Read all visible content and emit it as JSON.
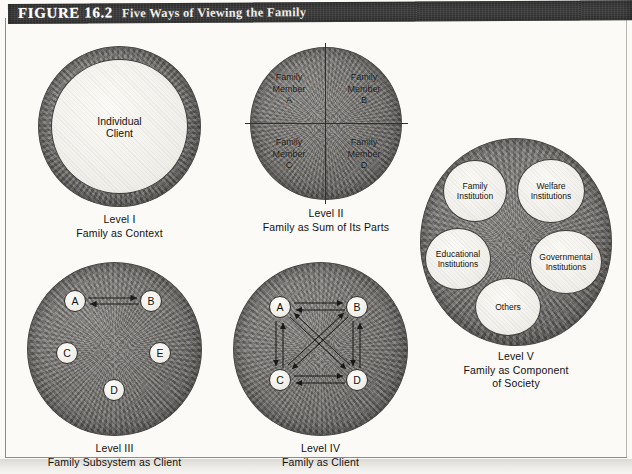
{
  "header": {
    "figure_label": "FIGURE 16.2",
    "figure_title": "Five Ways of Viewing the Family"
  },
  "levels": [
    {
      "id": "level-1",
      "caption_line1": "Level I",
      "caption_line2": "Family as Context",
      "center_label_line1": "Individual",
      "center_label_line2": "Client"
    },
    {
      "id": "level-2",
      "caption_line1": "Level II",
      "caption_line2": "Family as Sum of Its Parts",
      "quadrants": [
        {
          "line1": "Family",
          "line2": "Member",
          "line3": "A"
        },
        {
          "line1": "Family",
          "line2": "Member",
          "line3": "B"
        },
        {
          "line1": "Family",
          "line2": "Member",
          "line3": "C"
        },
        {
          "line1": "Family",
          "line2": "Member",
          "line3": "D"
        }
      ]
    },
    {
      "id": "level-3",
      "caption_line1": "Level III",
      "caption_line2": "Family Subsystem as Client",
      "nodes": [
        "A",
        "B",
        "C",
        "E",
        "D"
      ],
      "connections": [
        "A<->B"
      ]
    },
    {
      "id": "level-4",
      "caption_line1": "Level IV",
      "caption_line2": "Family as Client",
      "nodes": [
        "A",
        "B",
        "C",
        "D"
      ],
      "connections": [
        "A<->B",
        "A<->C",
        "A<->D",
        "B<->C",
        "B<->D",
        "C<->D"
      ]
    },
    {
      "id": "level-5",
      "caption_line1": "Level V",
      "caption_line2": "Family as Component",
      "caption_line3": "of Society",
      "institutions": [
        {
          "line1": "Family",
          "line2": "Institution"
        },
        {
          "line1": "Welfare",
          "line2": "Institutions"
        },
        {
          "line1": "Educational",
          "line2": "Institutions"
        },
        {
          "line1": "Governmental",
          "line2": "Institutions"
        },
        {
          "line1": "Others",
          "line2": ""
        }
      ]
    }
  ],
  "colors": {
    "header_bar": "#3b3b3b",
    "header_text": "#ffffff",
    "dark_disc": "#767471",
    "light_disc": "#f2f0ea",
    "outline": "#2f2d2a",
    "page_background": "#fbfaf7"
  }
}
